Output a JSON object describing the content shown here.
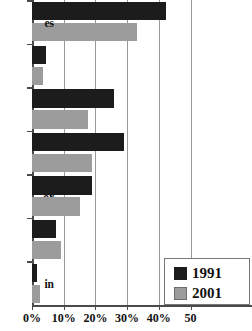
{
  "chart_data": {
    "type": "bar",
    "orientation": "horizontal",
    "title": "",
    "xlabel": "",
    "ylabel": "",
    "xlim": [
      0,
      50
    ],
    "xticks": [
      0,
      10,
      20,
      30,
      40,
      50
    ],
    "xtick_labels": [
      "0%",
      "10%",
      "20%",
      "30%",
      "40%",
      "50"
    ],
    "grid": true,
    "legend_position": "bottom-right",
    "categories": [
      "es",
      "to\n2",
      "or",
      "in",
      "pt",
      "re",
      "ry\ne"
    ],
    "series": [
      {
        "name": "1991",
        "color": "#1c1c1c",
        "values": [
          42.3,
          4.5,
          26.0,
          29.0,
          19.0,
          7.5,
          1.5
        ]
      },
      {
        "name": "2001",
        "color": "#9c9c9c",
        "values": [
          33.0,
          3.5,
          17.7,
          19.0,
          15.0,
          9.0,
          2.5
        ]
      }
    ]
  },
  "legend": {
    "entries": [
      {
        "label": "1991",
        "swatch": "black-swatch-icon"
      },
      {
        "label": "2001",
        "swatch": "gray-swatch-icon"
      }
    ]
  }
}
